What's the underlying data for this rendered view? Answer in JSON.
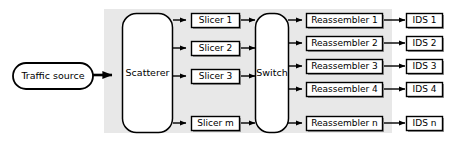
{
  "diagram": {
    "background_color": "#ffffff",
    "highlight_region_color": "#e8e8e8",
    "node_fill_color": "#ffffff",
    "stroke_color": "#000000",
    "shadow_color": "#808080",
    "source": {
      "label": "Traffic source",
      "shape": "stadium"
    },
    "scatterer": {
      "label": "Scatterer",
      "shape": "rounded-rect"
    },
    "switch": {
      "label": "Switch",
      "shape": "rounded-rect"
    },
    "slicers": [
      {
        "label": "Slicer 1"
      },
      {
        "label": "Slicer 2"
      },
      {
        "label": "Slicer 3"
      },
      {
        "label": "Slicer m"
      }
    ],
    "reassemblers": [
      {
        "label": "Reassembler 1"
      },
      {
        "label": "Reassembler 2"
      },
      {
        "label": "Reassembler 3"
      },
      {
        "label": "Reassembler 4"
      },
      {
        "label": "Reassembler n"
      }
    ],
    "ids_units": [
      {
        "label": "IDS 1"
      },
      {
        "label": "IDS 2"
      },
      {
        "label": "IDS 3"
      },
      {
        "label": "IDS 4"
      },
      {
        "label": "IDS n"
      }
    ]
  }
}
